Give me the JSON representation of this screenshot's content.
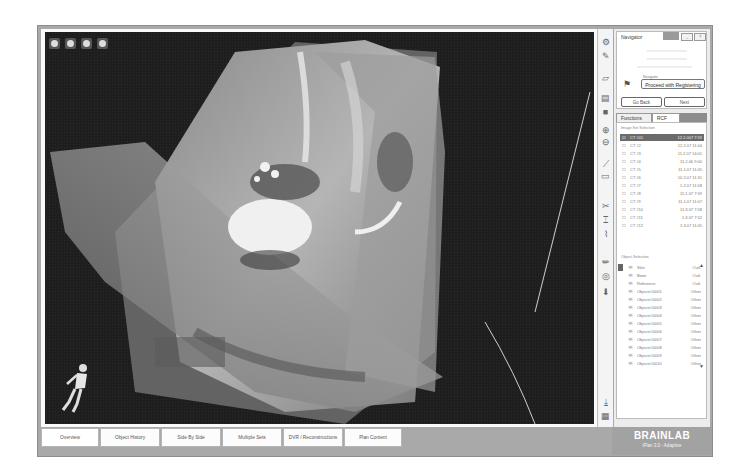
{
  "viewer": {
    "toolbar_icons": [
      "zoom-icon",
      "rotate-icon",
      "pan-icon",
      "hand-icon"
    ],
    "background_color": "#1e1e1e"
  },
  "right_toolbar": {
    "icons": [
      "display-settings-icon",
      "brush-icon",
      "slice-icon",
      "layers-icon",
      "object-icon",
      "zoom-in-icon",
      "zoom-out-icon",
      "measure-icon",
      "screenshot-icon",
      "cut-icon",
      "cut-alt-icon",
      "multi-cut-icon",
      "pencil-icon",
      "target-icon",
      "fill-icon",
      "export-icon",
      "grid-icon"
    ]
  },
  "navigator": {
    "title": "Navigator",
    "controls": [
      "_",
      "?"
    ],
    "dropdown_label": "Navigator",
    "dropdown_value": "Proceed with Registering",
    "back_label": "Go Back",
    "next_label": "Next"
  },
  "panel_tabs": [
    {
      "label": "Functions",
      "active": false
    },
    {
      "label": "RCF",
      "active": true
    }
  ],
  "image_sets": {
    "section_label": "Image Set Selection",
    "rows": [
      {
        "name": "CT #01",
        "value": "12.2.007 7:59",
        "selected": true
      },
      {
        "name": "CT #2",
        "value": "12.2.07 11:04",
        "selected": false
      },
      {
        "name": "CT #3",
        "value": "11.2.07 14:01",
        "selected": false
      },
      {
        "name": "CT #4",
        "value": "11.2.06 9:00",
        "selected": false
      },
      {
        "name": "CT #5",
        "value": "11.1.07 11:05",
        "selected": false
      },
      {
        "name": "CT #6",
        "value": "10.2.07 11:31",
        "selected": false
      },
      {
        "name": "CT #7",
        "value": "1.2.07 11:58",
        "selected": false
      },
      {
        "name": "CT #8",
        "value": "11.1.07 7:59",
        "selected": false
      },
      {
        "name": "CT #9",
        "value": "11.1.07 11:07",
        "selected": false
      },
      {
        "name": "CT #10",
        "value": "11.3.07 7:58",
        "selected": false
      },
      {
        "name": "CT #11",
        "value": "1.3.07 7:52",
        "selected": false
      },
      {
        "name": "CT #12",
        "value": "1.3.07 11:05",
        "selected": false
      }
    ]
  },
  "objects": {
    "section_label": "Object Selection",
    "rows": [
      {
        "name": "Skin",
        "value": "Outl."
      },
      {
        "name": "Bone",
        "value": "Outl."
      },
      {
        "name": "Reference",
        "value": "Outl."
      },
      {
        "name": "Objects#0001",
        "value": "Other"
      },
      {
        "name": "Objects#0002",
        "value": "Other"
      },
      {
        "name": "Objects#0003",
        "value": "Other"
      },
      {
        "name": "Objects#0004",
        "value": "Other"
      },
      {
        "name": "Objects#0005",
        "value": "Other"
      },
      {
        "name": "Objects#0006",
        "value": "Other"
      },
      {
        "name": "Objects#0007",
        "value": "Other"
      },
      {
        "name": "Objects#0008",
        "value": "Other"
      },
      {
        "name": "Objects#0009",
        "value": "Other"
      },
      {
        "name": "Objects#0010",
        "value": "Other"
      }
    ]
  },
  "bottom_tabs": [
    {
      "label": "Overview",
      "width": 72
    },
    {
      "label": "Object History",
      "width": 62
    },
    {
      "label": "Side By Side",
      "width": 62
    },
    {
      "label": "Multiple Sets",
      "width": 62
    },
    {
      "label": "DVR / Reconstructions",
      "width": 62
    },
    {
      "label": "Plan Content",
      "width": 62
    }
  ],
  "branding": {
    "logo": "BRAINLAB",
    "subtitle": "iPlan 3.0 - Adaptive"
  }
}
